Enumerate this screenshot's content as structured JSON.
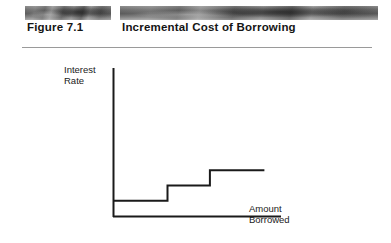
{
  "header": {
    "figure_number": "Figure 7.1",
    "figure_title": "Incremental Cost of Borrowing",
    "band_left_name": "texture-band-left",
    "band_right_name": "texture-band-right"
  },
  "axes": {
    "y_label_line1": "Interest",
    "y_label_line2": "Rate",
    "x_label_line1": "Amount",
    "x_label_line2": "Borrowed"
  },
  "colors": {
    "line": "#1a1a1a",
    "axis": "#1a1a1a",
    "rule": "#9a9a9a",
    "text": "#151515",
    "background": "#ffffff"
  },
  "chart_data": {
    "type": "line",
    "title": "Incremental Cost of Borrowing",
    "xlabel": "Amount Borrowed",
    "ylabel": "Interest Rate",
    "grid": false,
    "legend": "none",
    "series": [
      {
        "name": "Incremental cost of borrowing",
        "style": "step",
        "points": [
          {
            "x": 0,
            "y": 1
          },
          {
            "x": 36,
            "y": 1
          },
          {
            "x": 36,
            "y": 2
          },
          {
            "x": 64,
            "y": 2
          },
          {
            "x": 64,
            "y": 3
          },
          {
            "x": 100,
            "y": 3
          }
        ]
      }
    ],
    "step_levels": [
      1,
      2,
      3
    ],
    "step_breakpoints": [
      36,
      64
    ],
    "xlim": [
      0,
      105
    ],
    "ylim": [
      0,
      4
    ],
    "xticks": [],
    "yticks": [],
    "annotations": []
  }
}
